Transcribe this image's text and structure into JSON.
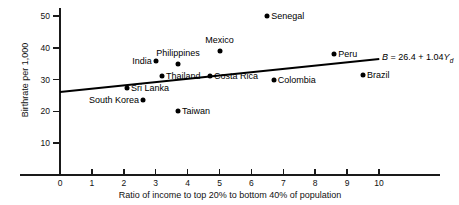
{
  "chart_data": {
    "type": "scatter",
    "title": "",
    "xlabel": "Ratio of income to top 20% to bottom 40% of population",
    "ylabel": "Birthrate per 1,000",
    "xlim": [
      0,
      10.8
    ],
    "ylim": [
      0,
      53
    ],
    "xticks": [
      0,
      1,
      2,
      3,
      4,
      5,
      6,
      7,
      8,
      9,
      10
    ],
    "yticks": [
      10,
      20,
      30,
      40,
      50
    ],
    "grid": false,
    "legend": "none",
    "points": [
      {
        "label": "Sri Lanka",
        "x": 2.1,
        "y": 27.5,
        "label_side": "right"
      },
      {
        "label": "South Korea",
        "x": 2.6,
        "y": 23.5,
        "label_side": "left"
      },
      {
        "label": "India",
        "x": 3.0,
        "y": 36.0,
        "label_side": "left"
      },
      {
        "label": "Thailand",
        "x": 3.2,
        "y": 31.0,
        "label_side": "right"
      },
      {
        "label": "Philippines",
        "x": 3.7,
        "y": 35.0,
        "label_side": "above"
      },
      {
        "label": "Taiwan",
        "x": 3.7,
        "y": 20.0,
        "label_side": "right"
      },
      {
        "label": "Costa Rica",
        "x": 4.7,
        "y": 31.0,
        "label_side": "right"
      },
      {
        "label": "Mexico",
        "x": 5.0,
        "y": 39.0,
        "label_side": "above"
      },
      {
        "label": "Senegal",
        "x": 6.5,
        "y": 50.0,
        "label_side": "right"
      },
      {
        "label": "Colombia",
        "x": 6.7,
        "y": 30.0,
        "label_side": "right"
      },
      {
        "label": "Peru",
        "x": 8.6,
        "y": 38.0,
        "label_side": "right"
      },
      {
        "label": "Brazil",
        "x": 9.5,
        "y": 31.5,
        "label_side": "right"
      }
    ],
    "regression": {
      "intercept": 26.4,
      "slope": 1.04,
      "x_start": 0.0,
      "x_end": 10.0,
      "equation_text": "B = 26.4 + 1.04Yd",
      "equation_parts": {
        "dependent": "B",
        "equals": " = ",
        "intercept_text": "26.4",
        "plus": " + ",
        "slope_text": "1.04",
        "independent": "Y",
        "subscript": "d"
      }
    }
  }
}
